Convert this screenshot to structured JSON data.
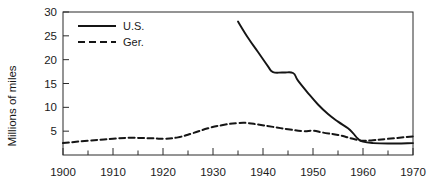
{
  "chart_data": {
    "type": "line",
    "title": "",
    "xlabel": "",
    "ylabel": "Millions of miles",
    "xlim": [
      1900,
      1970
    ],
    "ylim": [
      0,
      30
    ],
    "xticks": [
      1900,
      1910,
      1920,
      1930,
      1940,
      1950,
      1960,
      1970
    ],
    "xtick_labels": [
      "1900",
      "1910",
      "1920",
      "1930",
      "1940",
      "1950",
      "1960",
      "1970"
    ],
    "xminor_ticks": [
      1905,
      1915,
      1925,
      1935,
      1945,
      1955,
      1965
    ],
    "yticks": [
      5,
      10,
      15,
      20,
      25,
      30
    ],
    "ytick_labels": [
      "5",
      "10",
      "15",
      "20",
      "25",
      "30"
    ],
    "grid": false,
    "legend_position": "top-left",
    "series": [
      {
        "name": "U.S.",
        "style": "solid",
        "color": "#151515",
        "x": [
          1935,
          1937,
          1939,
          1941,
          1942,
          1944,
          1946,
          1947,
          1949,
          1951,
          1953,
          1955,
          1957,
          1958,
          1959,
          1960,
          1962,
          1965,
          1970
        ],
        "values": [
          28.0,
          24.6,
          21.6,
          18.6,
          17.4,
          17.3,
          17.2,
          15.6,
          13.0,
          10.6,
          8.6,
          7.0,
          5.6,
          4.6,
          3.4,
          2.8,
          2.5,
          2.4,
          2.5
        ]
      },
      {
        "name": "Ger.",
        "style": "dashed",
        "color": "#151515",
        "x": [
          1900,
          1905,
          1910,
          1913,
          1918,
          1920,
          1923,
          1926,
          1929,
          1932,
          1935,
          1937,
          1939,
          1942,
          1945,
          1948,
          1950,
          1952,
          1955,
          1958,
          1960,
          1962,
          1965,
          1970
        ],
        "values": [
          2.5,
          3.0,
          3.4,
          3.6,
          3.5,
          3.4,
          3.7,
          4.6,
          5.6,
          6.3,
          6.7,
          6.7,
          6.4,
          5.9,
          5.4,
          5.0,
          5.1,
          4.7,
          4.2,
          3.4,
          3.0,
          3.1,
          3.4,
          3.9
        ]
      }
    ],
    "legend": [
      {
        "label": "U.S.",
        "style": "solid"
      },
      {
        "label": "Ger.",
        "style": "dashed"
      }
    ]
  }
}
